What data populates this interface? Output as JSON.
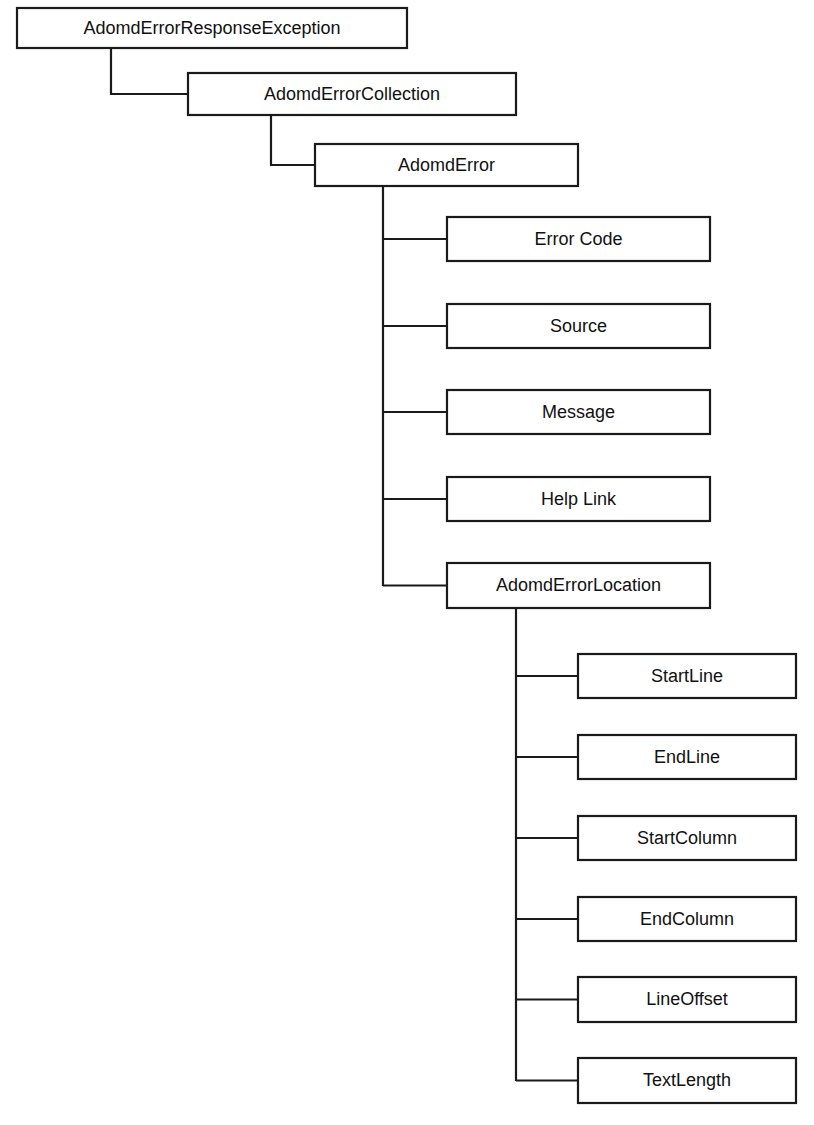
{
  "diagram": {
    "type": "class-hierarchy-tree",
    "background_color": "#ffffff",
    "line_color": "#1a1a1a",
    "box_fill_color": "#ffffff",
    "text_color": "#111111",
    "nodes": [
      {
        "id": "adomd-error-response-exception",
        "label": "AdomdErrorResponseException",
        "level": 0,
        "x": 17,
        "y": 8,
        "width": 390,
        "height": 40
      },
      {
        "id": "adomd-error-collection",
        "label": "AdomdErrorCollection",
        "level": 1,
        "x": 188,
        "y": 73,
        "width": 328,
        "height": 42
      },
      {
        "id": "adomd-error",
        "label": "AdomdError",
        "level": 2,
        "x": 315,
        "y": 144,
        "width": 263,
        "height": 42
      },
      {
        "id": "error-code",
        "label": "Error Code",
        "level": 3,
        "x": 447,
        "y": 217,
        "width": 263,
        "height": 44
      },
      {
        "id": "source",
        "label": "Source",
        "level": 3,
        "x": 447,
        "y": 304,
        "width": 263,
        "height": 44
      },
      {
        "id": "message",
        "label": "Message",
        "level": 3,
        "x": 447,
        "y": 390,
        "width": 263,
        "height": 44
      },
      {
        "id": "help-link",
        "label": "Help Link",
        "level": 3,
        "x": 447,
        "y": 477,
        "width": 263,
        "height": 44
      },
      {
        "id": "adomd-error-location",
        "label": "AdomdErrorLocation",
        "level": 3,
        "x": 447,
        "y": 563,
        "width": 263,
        "height": 45
      },
      {
        "id": "start-line",
        "label": "StartLine",
        "level": 4,
        "x": 578,
        "y": 654,
        "width": 218,
        "height": 44
      },
      {
        "id": "end-line",
        "label": "EndLine",
        "level": 4,
        "x": 578,
        "y": 735,
        "width": 218,
        "height": 44
      },
      {
        "id": "start-column",
        "label": "StartColumn",
        "level": 4,
        "x": 578,
        "y": 816,
        "width": 218,
        "height": 44
      },
      {
        "id": "end-column",
        "label": "EndColumn",
        "level": 4,
        "x": 578,
        "y": 897,
        "width": 218,
        "height": 44
      },
      {
        "id": "line-offset",
        "label": "LineOffset",
        "level": 4,
        "x": 578,
        "y": 977,
        "width": 218,
        "height": 45
      },
      {
        "id": "text-length",
        "label": "TextLength",
        "level": 4,
        "x": 578,
        "y": 1058,
        "width": 218,
        "height": 45
      }
    ],
    "edges": [
      {
        "id": "edge-exception-to-collection",
        "from": "adomd-error-response-exception",
        "to": "adomd-error-collection",
        "shape": "elbow"
      },
      {
        "id": "edge-collection-to-error",
        "from": "adomd-error-collection",
        "to": "adomd-error",
        "shape": "elbow"
      },
      {
        "id": "edge-error-to-error-code",
        "from": "adomd-error",
        "to": "error-code",
        "shape": "trunk-branch"
      },
      {
        "id": "edge-error-to-source",
        "from": "adomd-error",
        "to": "source",
        "shape": "trunk-branch"
      },
      {
        "id": "edge-error-to-message",
        "from": "adomd-error",
        "to": "message",
        "shape": "trunk-branch"
      },
      {
        "id": "edge-error-to-help-link",
        "from": "adomd-error",
        "to": "help-link",
        "shape": "trunk-branch"
      },
      {
        "id": "edge-error-to-location",
        "from": "adomd-error",
        "to": "adomd-error-location",
        "shape": "trunk-branch"
      },
      {
        "id": "edge-location-to-start-line",
        "from": "adomd-error-location",
        "to": "start-line",
        "shape": "trunk-branch"
      },
      {
        "id": "edge-location-to-end-line",
        "from": "adomd-error-location",
        "to": "end-line",
        "shape": "trunk-branch"
      },
      {
        "id": "edge-location-to-start-column",
        "from": "adomd-error-location",
        "to": "start-column",
        "shape": "trunk-branch"
      },
      {
        "id": "edge-location-to-end-column",
        "from": "adomd-error-location",
        "to": "end-column",
        "shape": "trunk-branch"
      },
      {
        "id": "edge-location-to-line-offset",
        "from": "adomd-error-location",
        "to": "line-offset",
        "shape": "trunk-branch"
      },
      {
        "id": "edge-location-to-text-length",
        "from": "adomd-error-location",
        "to": "text-length",
        "shape": "trunk-branch"
      }
    ],
    "trunks": [
      {
        "id": "trunk-adomd-error",
        "x": 383,
        "y_top": 186,
        "y_bottom": 586
      },
      {
        "id": "trunk-adomd-error-location",
        "x": 516,
        "y_top": 608,
        "y_bottom": 1081
      }
    ],
    "elbows": [
      {
        "id": "elbow-exception",
        "x": 111,
        "y_top": 48,
        "y_bottom": 94,
        "x_end": 188
      },
      {
        "id": "elbow-collection",
        "x": 271,
        "y_top": 115,
        "y_bottom": 165,
        "x_end": 315
      }
    ]
  }
}
